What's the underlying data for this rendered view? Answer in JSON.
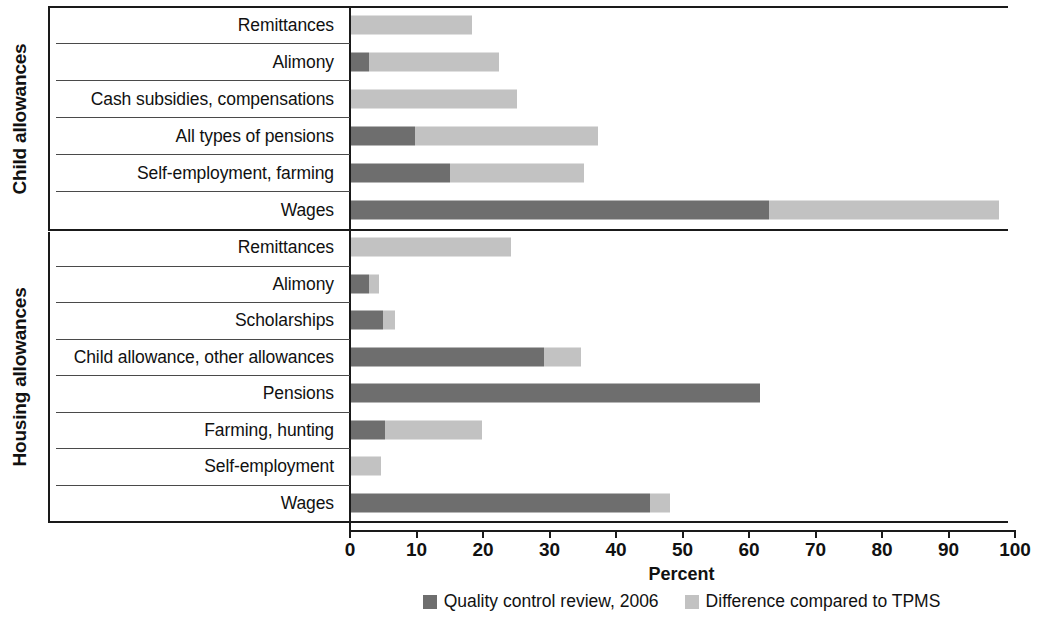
{
  "chart_data": {
    "type": "bar",
    "orientation": "horizontal",
    "stacked": true,
    "title": "",
    "xlabel": "Percent",
    "ylabel": "",
    "xlim": [
      0,
      100
    ],
    "xticks": [
      0,
      10,
      20,
      30,
      40,
      50,
      60,
      70,
      80,
      90,
      100
    ],
    "xtick_labels": [
      "0",
      "10",
      "20",
      "30",
      "40",
      "50",
      "60",
      "70",
      "80",
      "90",
      "100"
    ],
    "grid": false,
    "legend_position": "bottom",
    "series": [
      {
        "name": "Quality control review, 2006",
        "color": "#6e6e6e"
      },
      {
        "name": "Difference compared to TPMS",
        "color": "#c2c2c2"
      }
    ],
    "groups": [
      {
        "name": "Child allowances",
        "categories": [
          "Remittances",
          "Alimony",
          "Cash subsidies, compensations",
          "All types of pensions",
          "Self-employment, farming",
          "Wages"
        ],
        "values": {
          "Quality control review, 2006": [
            0,
            2.7,
            0,
            9.6,
            14.9,
            62.9
          ],
          "Difference compared to TPMS": [
            18.2,
            19.6,
            25.0,
            27.5,
            20.1,
            34.5
          ]
        },
        "totals": [
          18.2,
          22.3,
          25.0,
          37.1,
          35.0,
          97.4
        ]
      },
      {
        "name": "Housing allowances",
        "categories": [
          "Remittances",
          "Alimony",
          "Scholarships",
          "Child allowance, other allowances",
          "Pensions",
          "Farming, hunting",
          "Self-employment",
          "Wages"
        ],
        "values": {
          "Quality control review, 2006": [
            0,
            2.7,
            4.8,
            29.0,
            61.5,
            5.1,
            0,
            45.0
          ],
          "Difference compared to TPMS": [
            24.0,
            1.5,
            1.8,
            5.6,
            0,
            14.6,
            4.5,
            3.0
          ]
        },
        "totals": [
          24.0,
          4.2,
          6.6,
          34.6,
          61.5,
          19.7,
          4.5,
          48.0
        ]
      }
    ]
  },
  "axis": {
    "xlabel": "Percent",
    "ticks": [
      "0",
      "10",
      "20",
      "30",
      "40",
      "50",
      "60",
      "70",
      "80",
      "90",
      "100"
    ]
  },
  "groups": {
    "child": "Child allowances",
    "housing": "Housing allowances"
  },
  "rows": {
    "child": [
      {
        "label": "Remittances",
        "dark": 0,
        "light": 18.2
      },
      {
        "label": "Alimony",
        "dark": 2.7,
        "light": 19.6
      },
      {
        "label": "Cash subsidies, compensations",
        "dark": 0,
        "light": 25.0
      },
      {
        "label": "All types of pensions",
        "dark": 9.6,
        "light": 27.5
      },
      {
        "label": "Self-employment, farming",
        "dark": 14.9,
        "light": 20.1
      },
      {
        "label": "Wages",
        "dark": 62.9,
        "light": 34.5
      }
    ],
    "housing": [
      {
        "label": "Remittances",
        "dark": 0,
        "light": 24.0
      },
      {
        "label": "Alimony",
        "dark": 2.7,
        "light": 1.5
      },
      {
        "label": "Scholarships",
        "dark": 4.8,
        "light": 1.8
      },
      {
        "label": "Child allowance, other allowances",
        "dark": 29.0,
        "light": 5.6
      },
      {
        "label": "Pensions",
        "dark": 61.5,
        "light": 0
      },
      {
        "label": "Farming, hunting",
        "dark": 5.1,
        "light": 14.6
      },
      {
        "label": "Self-employment",
        "dark": 0,
        "light": 4.5
      },
      {
        "label": "Wages",
        "dark": 45.0,
        "light": 3.0
      }
    ]
  },
  "legend": {
    "items": [
      {
        "label": "Quality control review, 2006",
        "color": "#6e6e6e"
      },
      {
        "label": "Difference compared to TPMS",
        "color": "#c2c2c2"
      }
    ]
  }
}
